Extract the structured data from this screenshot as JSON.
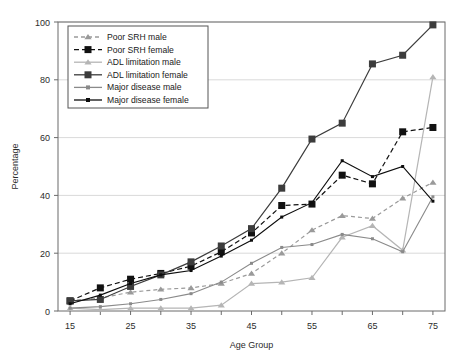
{
  "chart_data": {
    "type": "line",
    "title": "",
    "xlabel": "Age Group",
    "ylabel": "Percentage",
    "xlim": [
      13,
      77
    ],
    "ylim": [
      0,
      100
    ],
    "ytick_values": [
      0,
      20,
      40,
      60,
      80,
      100
    ],
    "ytick_labels": [
      "0",
      "20",
      "40",
      "60",
      "80",
      "100"
    ],
    "xtick_values": [
      15,
      20,
      25,
      30,
      35,
      40,
      45,
      50,
      55,
      60,
      65,
      70,
      75
    ],
    "xtick_labels": [
      "15",
      "",
      "25",
      "",
      "35",
      "",
      "45",
      "",
      "55",
      "",
      "65",
      "",
      "75"
    ],
    "grid": "horizontal",
    "legend_position": "upper-left",
    "x": [
      15,
      20,
      25,
      30,
      35,
      40,
      45,
      50,
      55,
      60,
      65,
      70,
      75
    ],
    "series": [
      {
        "name": "Poor SRH male",
        "color": "#9a9a9a",
        "dash": "4,3",
        "marker": "triangle",
        "marker_size": 5,
        "values": [
          3.5,
          4.5,
          6.5,
          7.5,
          8.0,
          9.5,
          13.0,
          20.0,
          28.0,
          33.0,
          32.0,
          39.0,
          44.5
        ]
      },
      {
        "name": "Poor SRH female",
        "color": "#111111",
        "dash": "5,3",
        "marker": "square",
        "marker_size": 7,
        "values": [
          3.5,
          8.0,
          11.0,
          13.0,
          15.5,
          20.5,
          27.0,
          36.5,
          37.0,
          47.0,
          44.0,
          62.0,
          63.5
        ]
      },
      {
        "name": "ADL limitation male",
        "color": "#b5b5b5",
        "dash": "none",
        "marker": "triangle",
        "marker_size": 5,
        "values": [
          1.0,
          0.5,
          1.0,
          1.0,
          1.0,
          2.0,
          9.5,
          10.0,
          11.5,
          25.5,
          29.5,
          21.0,
          81.0
        ]
      },
      {
        "name": "ADL limitation female",
        "color": "#3c3c3c",
        "dash": "none",
        "marker": "square",
        "marker_size": 7,
        "values": [
          3.5,
          4.0,
          8.5,
          12.5,
          17.0,
          22.5,
          28.5,
          42.5,
          59.5,
          65.0,
          85.5,
          88.5,
          99.0
        ]
      },
      {
        "name": "Major disease male",
        "color": "#8a8a8a",
        "dash": "none",
        "marker": "dot",
        "marker_size": 3,
        "values": [
          1.0,
          1.5,
          2.5,
          4.0,
          6.0,
          10.0,
          16.5,
          22.0,
          23.0,
          26.5,
          25.0,
          20.5,
          39.5
        ]
      },
      {
        "name": "Major disease female",
        "color": "#0d0d0d",
        "dash": "none",
        "marker": "dot",
        "marker_size": 3,
        "values": [
          2.5,
          5.5,
          9.5,
          12.5,
          14.0,
          19.0,
          24.5,
          32.5,
          37.5,
          52.0,
          46.5,
          50.0,
          38.0
        ]
      }
    ]
  },
  "axes": {
    "ylabel": "Percentage",
    "xlabel": "Age Group"
  },
  "legend": {
    "items": [
      {
        "label": "Poor SRH male"
      },
      {
        "label": "Poor SRH female"
      },
      {
        "label": "ADL limitation male"
      },
      {
        "label": "ADL limitation female"
      },
      {
        "label": "Major disease male"
      },
      {
        "label": "Major disease female"
      }
    ]
  }
}
